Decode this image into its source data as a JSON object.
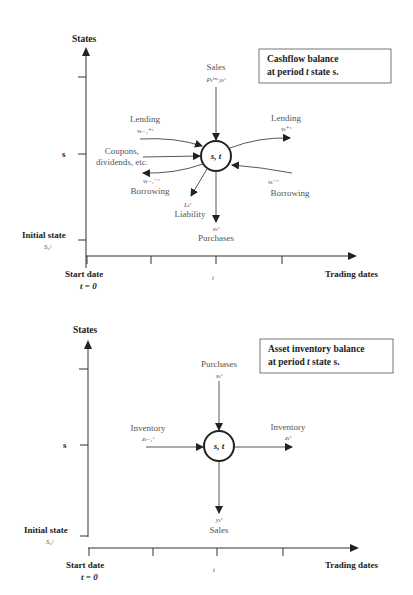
{
  "diagram_top": {
    "title_line1": "Cashflow balance",
    "title_line2_prefix": "at period ",
    "title_line2_t": "t",
    "title_line2_suffix": " state s.",
    "y_axis_label": "States",
    "x_axis_label": "Trading dates",
    "state_tick_label": "s",
    "initial_state_label": "Initial state",
    "initial_state_symbol": "S₀ʲ",
    "start_date_label": "Start date",
    "start_date_value": "t = 0",
    "t_tick_label": "t",
    "node_label": "s, t",
    "flows": {
      "sales_label": "Sales",
      "sales_symbol": "Pₜʰᵐ yₜˢ",
      "lending_in_label": "Lending",
      "lending_in_symbol": "vₜ₋₁⁺ˢ",
      "coupons_label_1": "Coupons,",
      "coupons_label_2": "dividends, etc.",
      "borrowing_out_symbol": "vₜ₋₁⁻ˢ",
      "borrowing_out_label": "Borrowing",
      "liability_symbol": "Lₜˢ",
      "liability_label": "Liability",
      "purchases_symbol": "xₜˢ",
      "purchases_label": "Purchases",
      "lending_out_label": "Lending",
      "lending_out_symbol": "vₜ⁺ˢ",
      "borrowing_in_symbol": "vₜ⁻ˢ",
      "borrowing_in_label": "Borrowing"
    }
  },
  "diagram_bottom": {
    "title_line1": "Asset inventory balance",
    "title_line2_prefix": "at period ",
    "title_line2_t": "t",
    "title_line2_suffix": " state s.",
    "y_axis_label": "States",
    "x_axis_label": "Trading dates",
    "state_tick_label": "s",
    "initial_state_label": "Initial state",
    "initial_state_symbol": "S₀ʲ",
    "start_date_label": "Start date",
    "start_date_value": "t = 0",
    "t_tick_label": "t",
    "node_label": "s, t",
    "flows": {
      "purchases_label": "Purchases",
      "purchases_symbol": "xₜˢ",
      "inventory_in_label": "Inventory",
      "inventory_in_symbol": "zₜ₋₁ˢ",
      "inventory_out_label": "Inventory",
      "inventory_out_symbol": "zₜˢ",
      "sales_symbol": "yₜˢ",
      "sales_label": "Sales"
    }
  },
  "colors": {
    "line": "#333333",
    "text": "#222222",
    "label": "#555555",
    "background": "#ffffff"
  }
}
